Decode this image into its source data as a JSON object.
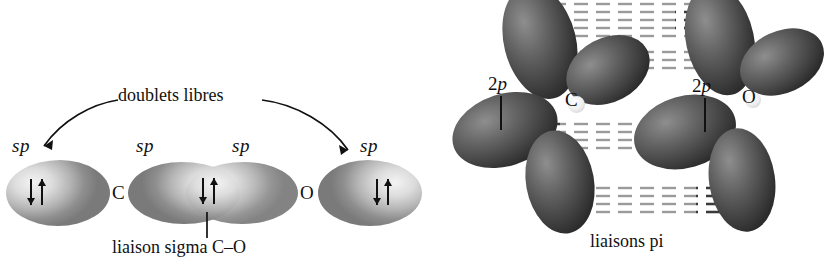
{
  "figure": {
    "background_color": "#ffffff",
    "ink_color": "#111111"
  },
  "sigma_panel": {
    "name": "sp hybrid orbital diagram",
    "caption": "liaison sigma C–O",
    "annotation": "doublets libres",
    "orbital_labels": [
      "sp",
      "sp",
      "sp",
      "sp"
    ],
    "atoms": [
      "C",
      "O"
    ],
    "electron_pairs": [
      {
        "location": "left sp lone pair",
        "spins": "↓↑"
      },
      {
        "location": "sigma bond C-O",
        "spins": "↓↑"
      },
      {
        "location": "right sp lone pair",
        "spins": "↓↑"
      }
    ]
  },
  "pi_panel": {
    "name": "2p orbital diagram",
    "caption": "liaisons pi",
    "orbital_labels": [
      "2p",
      "2p"
    ],
    "atoms": [
      "C",
      "O"
    ],
    "lobe_count_per_atom": 4,
    "overlap_style": "horizontal dashed hatching"
  }
}
